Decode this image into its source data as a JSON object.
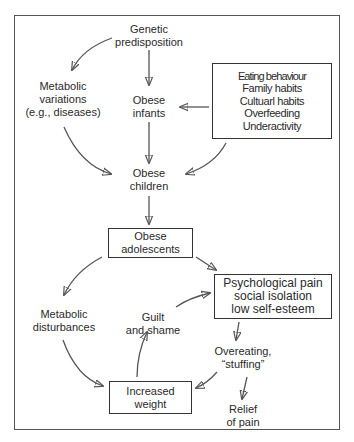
{
  "diagram": {
    "nodes": {
      "genetic": {
        "lines": [
          "Genetic",
          "predisposition"
        ]
      },
      "metabolic_variations": {
        "lines": [
          "Metabolic",
          "variations",
          "(e.g., diseases)"
        ]
      },
      "obese_infants": {
        "lines": [
          "Obese",
          "infants"
        ]
      },
      "environmental_factors": {
        "lines": [
          "Eating behaviour",
          "Family habits",
          "Cultuarl habits",
          "Overfeeding",
          "Underactivity"
        ]
      },
      "obese_children": {
        "lines": [
          "Obese",
          "children"
        ]
      },
      "obese_adolescents": {
        "lines": [
          "Obese",
          "adolescents"
        ]
      },
      "metabolic_disturbances": {
        "lines": [
          "Metabolic",
          "disturbances"
        ]
      },
      "guilt_shame": {
        "lines": [
          "Guilt",
          "and shame"
        ]
      },
      "psychological_pain": {
        "lines": [
          "Psychological pain",
          "social isolation",
          "low self-esteem"
        ]
      },
      "overeating": {
        "lines": [
          "Overeating,",
          "“stuffing”"
        ]
      },
      "increased_weight": {
        "lines": [
          "Increased",
          "weight"
        ]
      },
      "relief": {
        "lines": [
          "Relief",
          "of pain"
        ]
      }
    },
    "edges": [
      {
        "from": "genetic",
        "to": "metabolic_variations"
      },
      {
        "from": "genetic",
        "to": "obese_infants"
      },
      {
        "from": "environmental_factors",
        "to": "obese_infants"
      },
      {
        "from": "metabolic_variations",
        "to": "obese_children"
      },
      {
        "from": "obese_infants",
        "to": "obese_children"
      },
      {
        "from": "environmental_factors",
        "to": "obese_children"
      },
      {
        "from": "obese_children",
        "to": "obese_adolescents"
      },
      {
        "from": "obese_adolescents",
        "to": "metabolic_disturbances"
      },
      {
        "from": "obese_adolescents",
        "to": "psychological_pain"
      },
      {
        "from": "metabolic_disturbances",
        "to": "increased_weight"
      },
      {
        "from": "increased_weight",
        "to": "guilt_shame"
      },
      {
        "from": "guilt_shame",
        "to": "psychological_pain"
      },
      {
        "from": "psychological_pain",
        "to": "overeating"
      },
      {
        "from": "overeating",
        "to": "increased_weight"
      },
      {
        "from": "overeating",
        "to": "relief"
      }
    ]
  }
}
